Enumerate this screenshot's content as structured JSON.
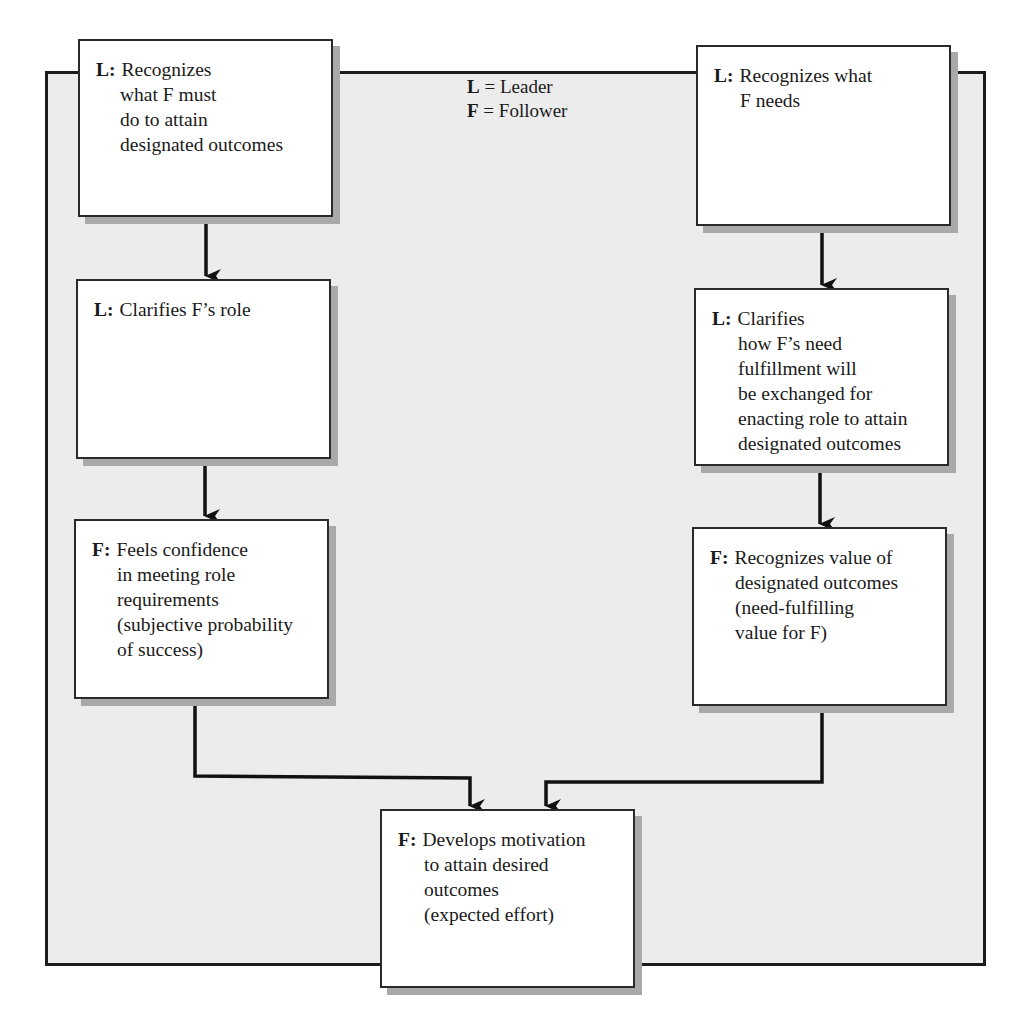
{
  "diagram": {
    "legend": [
      {
        "key": "L",
        "sep": " = ",
        "meaning": "Leader"
      },
      {
        "key": "F",
        "sep": " = ",
        "meaning": "Follower"
      }
    ],
    "boxes": {
      "l_recognizes_what_f_must_do": {
        "role": "L:",
        "lines": [
          "Recognizes",
          "what F must",
          "do to attain",
          "designated outcomes"
        ]
      },
      "l_recognizes_what_f_needs": {
        "role": "L:",
        "lines": [
          "Recognizes what",
          "F needs"
        ]
      },
      "l_clarifies_f_role": {
        "role": "L:",
        "lines": [
          "Clarifies F’s role"
        ]
      },
      "l_clarifies_need_exchange": {
        "role": "L:",
        "lines": [
          "Clarifies",
          "how F’s need",
          "fulfillment will",
          "be exchanged for",
          "enacting role to attain",
          "designated outcomes"
        ]
      },
      "f_feels_confidence": {
        "role": "F:",
        "lines": [
          "Feels confidence",
          "in meeting role",
          "requirements",
          "(subjective probability",
          "of success)"
        ]
      },
      "f_recognizes_value": {
        "role": "F:",
        "lines": [
          "Recognizes value of",
          "designated outcomes",
          "(need-fulfilling",
          "value for F)"
        ]
      },
      "f_develops_motivation": {
        "role": "F:",
        "lines": [
          "Develops motivation",
          "to attain desired",
          "outcomes",
          "(expected effort)"
        ]
      }
    },
    "edges": [
      {
        "from": "l_recognizes_what_f_must_do",
        "to": "l_clarifies_f_role"
      },
      {
        "from": "l_clarifies_f_role",
        "to": "f_feels_confidence"
      },
      {
        "from": "l_recognizes_what_f_needs",
        "to": "l_clarifies_need_exchange"
      },
      {
        "from": "l_clarifies_need_exchange",
        "to": "f_recognizes_value"
      },
      {
        "from": "f_feels_confidence",
        "to": "f_develops_motivation"
      },
      {
        "from": "f_recognizes_value",
        "to": "f_develops_motivation"
      }
    ],
    "colors": {
      "frame_background": "#ececec",
      "box_background": "#ffffff",
      "line": "#1c1c1c",
      "shadow": "#a9a9a9"
    }
  }
}
